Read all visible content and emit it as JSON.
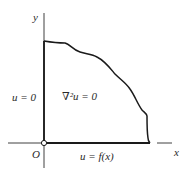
{
  "diagram": {
    "title": "",
    "axes": {
      "x_label": "x",
      "y_label": "y",
      "origin_label": "O"
    },
    "region": {
      "equation": "∇²u = 0",
      "left_boundary_condition": "u = 0",
      "bottom_boundary_condition": "u = f(x)"
    },
    "colors": {
      "stroke": "#1a1a1a",
      "background": "#ffffff",
      "text": "#2a2a2a"
    }
  }
}
